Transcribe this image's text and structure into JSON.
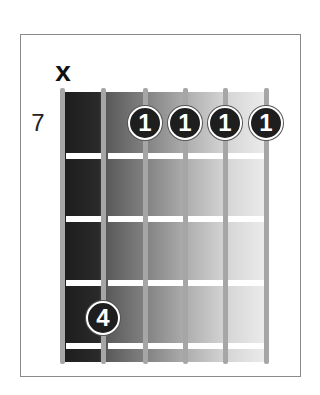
{
  "chord_diagram": {
    "start_fret_label": "7",
    "muted_marker": "x",
    "strings": [
      {
        "index": 1,
        "state": "muted"
      },
      {
        "index": 2,
        "finger": "4",
        "fret_offset": 4
      },
      {
        "index": 3,
        "finger": "1",
        "fret_offset": 1
      },
      {
        "index": 4,
        "finger": "1",
        "fret_offset": 1
      },
      {
        "index": 5,
        "finger": "1",
        "fret_offset": 1
      },
      {
        "index": 6,
        "finger": "1",
        "fret_offset": 1
      }
    ],
    "frets_shown": 4,
    "fingers": {
      "barre": [
        "1",
        "1",
        "1",
        "1"
      ],
      "pinky": "4"
    },
    "colors": {
      "dot_fill": "#1e1e1e",
      "dot_text": "#ffffff",
      "string": "#a6a6a6",
      "fret": "#ffffff",
      "frame_border": "#8a8a8a"
    }
  }
}
